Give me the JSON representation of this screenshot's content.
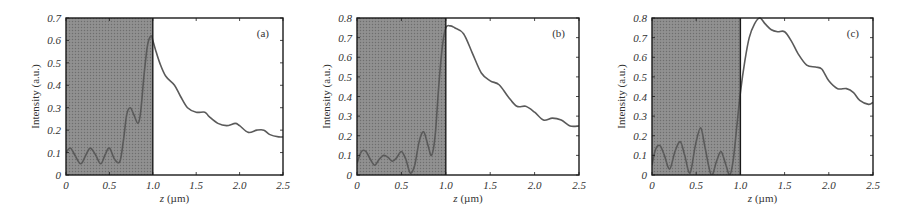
{
  "figure": {
    "colors": {
      "shade": "#8c8c8c",
      "shade_dots": "#6e6e6e",
      "curve": "#5a5a5a",
      "frame": "#1a1a1a",
      "text": "#333333"
    }
  },
  "chart_data": [
    {
      "type": "line",
      "panel_label": "(a)",
      "title": "",
      "xlabel": "z (µm)",
      "ylabel": "Intensity (a.u.)",
      "xlim": [
        0,
        2.5
      ],
      "ylim": [
        0,
        0.7
      ],
      "xticks": [
        "0",
        "0.5",
        "1.0",
        "1.5",
        "2.0",
        "2.5"
      ],
      "yticks": [
        "0",
        "0.1",
        "0.2",
        "0.3",
        "0.4",
        "0.5",
        "0.6",
        "0.7"
      ],
      "shaded_region": [
        0,
        1.0
      ],
      "box": {
        "left": 66,
        "top": 18,
        "right": 283,
        "bottom": 175
      },
      "x": [
        0,
        0.05,
        0.1,
        0.17,
        0.23,
        0.28,
        0.34,
        0.4,
        0.45,
        0.5,
        0.56,
        0.62,
        0.66,
        0.7,
        0.74,
        0.78,
        0.83,
        0.86,
        0.9,
        0.94,
        0.98,
        1.0,
        1.03,
        1.08,
        1.15,
        1.25,
        1.32,
        1.4,
        1.5,
        1.6,
        1.65,
        1.75,
        1.85,
        1.95,
        2.0,
        2.1,
        2.2,
        2.28,
        2.35,
        2.45,
        2.5
      ],
      "values": [
        0.1,
        0.12,
        0.09,
        0.05,
        0.09,
        0.12,
        0.09,
        0.05,
        0.09,
        0.12,
        0.07,
        0.06,
        0.15,
        0.27,
        0.3,
        0.27,
        0.23,
        0.28,
        0.45,
        0.58,
        0.62,
        0.6,
        0.56,
        0.5,
        0.44,
        0.4,
        0.35,
        0.3,
        0.28,
        0.28,
        0.26,
        0.23,
        0.22,
        0.23,
        0.22,
        0.19,
        0.2,
        0.2,
        0.18,
        0.17,
        0.17
      ]
    },
    {
      "type": "line",
      "panel_label": "(b)",
      "title": "",
      "xlabel": "z (µm)",
      "ylabel": "Intensity (a.u.)",
      "xlim": [
        0,
        2.5
      ],
      "ylim": [
        0,
        0.8
      ],
      "xticks": [
        "0",
        "0.5",
        "1.0",
        "1.5",
        "2.0",
        "2.5"
      ],
      "yticks": [
        "0",
        "0.1",
        "0.2",
        "0.3",
        "0.4",
        "0.5",
        "0.6",
        "0.7",
        "0.8"
      ],
      "shaded_region": [
        0,
        1.0
      ],
      "box": {
        "left": 357,
        "top": 18,
        "right": 579,
        "bottom": 175
      },
      "x": [
        0,
        0.05,
        0.1,
        0.15,
        0.2,
        0.25,
        0.3,
        0.35,
        0.4,
        0.45,
        0.5,
        0.55,
        0.6,
        0.65,
        0.7,
        0.75,
        0.8,
        0.84,
        0.88,
        0.92,
        0.96,
        1.0,
        1.05,
        1.1,
        1.2,
        1.3,
        1.4,
        1.5,
        1.6,
        1.7,
        1.8,
        1.9,
        2.0,
        2.1,
        2.2,
        2.3,
        2.4,
        2.5
      ],
      "values": [
        0.06,
        0.12,
        0.12,
        0.08,
        0.05,
        0.08,
        0.1,
        0.09,
        0.07,
        0.09,
        0.12,
        0.08,
        0.01,
        0.05,
        0.17,
        0.22,
        0.15,
        0.1,
        0.2,
        0.45,
        0.65,
        0.75,
        0.76,
        0.75,
        0.72,
        0.62,
        0.52,
        0.48,
        0.46,
        0.4,
        0.35,
        0.35,
        0.32,
        0.28,
        0.29,
        0.28,
        0.25,
        0.25
      ]
    },
    {
      "type": "line",
      "panel_label": "(c)",
      "title": "",
      "xlabel": "z (µm)",
      "ylabel": "Intensity (a.u.)",
      "xlim": [
        0,
        2.5
      ],
      "ylim": [
        0,
        0.8
      ],
      "xticks": [
        "0",
        "0.5",
        "1.0",
        "1.5",
        "2.0",
        "2.5"
      ],
      "yticks": [
        "0",
        "0.1",
        "0.2",
        "0.3",
        "0.4",
        "0.5",
        "0.6",
        "0.7",
        "0.8"
      ],
      "shaded_region": [
        0,
        1.0
      ],
      "box": {
        "left": 652,
        "top": 18,
        "right": 873,
        "bottom": 175
      },
      "x": [
        0,
        0.04,
        0.09,
        0.14,
        0.2,
        0.26,
        0.32,
        0.37,
        0.43,
        0.49,
        0.55,
        0.6,
        0.67,
        0.73,
        0.78,
        0.83,
        0.88,
        0.92,
        0.96,
        1.0,
        1.05,
        1.1,
        1.16,
        1.22,
        1.28,
        1.35,
        1.42,
        1.5,
        1.58,
        1.65,
        1.75,
        1.85,
        1.92,
        2.0,
        2.1,
        2.2,
        2.28,
        2.35,
        2.45,
        2.5
      ],
      "values": [
        0.05,
        0.13,
        0.15,
        0.1,
        0.03,
        0.12,
        0.17,
        0.1,
        0.01,
        0.15,
        0.24,
        0.14,
        0.0,
        0.07,
        0.12,
        0.06,
        0.0,
        0.08,
        0.25,
        0.42,
        0.58,
        0.7,
        0.77,
        0.8,
        0.77,
        0.74,
        0.73,
        0.73,
        0.68,
        0.62,
        0.56,
        0.55,
        0.54,
        0.48,
        0.44,
        0.44,
        0.42,
        0.38,
        0.36,
        0.37
      ]
    }
  ]
}
